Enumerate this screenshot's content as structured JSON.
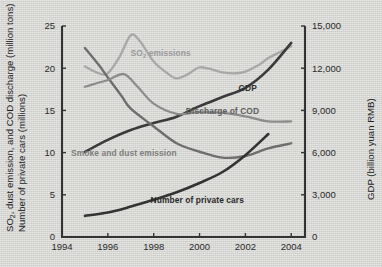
{
  "chart_data": {
    "type": "line",
    "title": "",
    "subtitle": "",
    "xlabel": "",
    "ylabel": "SO2, dust emission, and COD discharge (million tons) Number of private cars (millions)",
    "ylabel_right": "GDP (billion yuan RMB)",
    "xlim": [
      1994,
      2004.6
    ],
    "ylim": [
      0,
      25
    ],
    "ylim_right": [
      0,
      15000
    ],
    "grid": false,
    "legend_position": "inline-annotations",
    "x_ticks": [
      "1994",
      "1996",
      "1998",
      "2000",
      "2002",
      "2004"
    ],
    "x_tick_values": [
      1994,
      1996,
      1998,
      2000,
      2002,
      2004
    ],
    "y_ticks_left": [
      "0",
      "5",
      "10",
      "15",
      "20",
      "25"
    ],
    "y_tick_values_left": [
      0,
      5,
      10,
      15,
      20,
      25
    ],
    "y_ticks_right": [
      "0",
      "3,000",
      "6,000",
      "9,000",
      "12,000",
      "15,000"
    ],
    "y_tick_values_right": [
      0,
      3000,
      6000,
      9000,
      12000,
      15000
    ],
    "series": [
      {
        "name": "SO2 emissions",
        "label": "SO2 emissions",
        "axis": "left",
        "color": "#a8a8a8",
        "width": 2.3,
        "x": [
          1995,
          1995.6,
          1996,
          1996.5,
          1997,
          1997.4,
          1998,
          1998.6,
          1999,
          1999.5,
          2000,
          2000.6,
          2001,
          2001.6,
          2002,
          2002.6,
          2003,
          2003.5,
          2004
        ],
        "values": [
          20.2,
          19.4,
          19.4,
          21.3,
          23.9,
          23.2,
          20.8,
          19.4,
          18.8,
          19.3,
          20.1,
          19.8,
          19.5,
          19.4,
          19.6,
          20.4,
          21.2,
          21.9,
          22.6
        ]
      },
      {
        "name": "GDP",
        "label": "GDP",
        "axis": "right",
        "color": "#3a3a3a",
        "width": 2.6,
        "x": [
          1995,
          1996,
          1997,
          1998,
          1999,
          2000,
          2001,
          2002,
          2003,
          2004
        ],
        "values": [
          6050,
          6900,
          7600,
          8100,
          8550,
          9300,
          9950,
          10600,
          11900,
          13800
        ]
      },
      {
        "name": "Discharge of COD",
        "label": "Discharge of COD",
        "axis": "left",
        "color": "#6e6e6e",
        "width": 2.4,
        "x": [
          1995,
          1995.6,
          1996,
          1996.6,
          1997,
          1998,
          1999,
          2000,
          2001,
          2002,
          2003,
          2004
        ],
        "values": [
          22.4,
          20.4,
          18.9,
          16.7,
          15.2,
          13.1,
          11.1,
          10.1,
          9.4,
          9.6,
          10.5,
          11.1
        ]
      },
      {
        "name": "Smoke and dust emission",
        "label": "Smoke and dust emission",
        "axis": "left",
        "color": "#8c8c8c",
        "width": 2.3,
        "x": [
          1995,
          1996,
          1996.7,
          1997.3,
          1998,
          1999,
          2000,
          2001,
          2002,
          2003,
          2004
        ],
        "values": [
          17.8,
          18.6,
          19.3,
          17.8,
          15.8,
          14.6,
          14.8,
          14.7,
          14.3,
          13.7,
          13.7
        ]
      },
      {
        "name": "Number of private cars",
        "label": "Number of private cars",
        "axis": "left",
        "color": "#333333",
        "width": 2.6,
        "x": [
          1995,
          1996,
          1997,
          1998,
          1999,
          2000,
          2001,
          2002,
          2003
        ],
        "values": [
          2.5,
          2.9,
          3.6,
          4.4,
          5.3,
          6.4,
          7.7,
          9.7,
          12.2
        ]
      }
    ],
    "annotations": [
      {
        "text": "SO2 emissions",
        "x": 1998.3,
        "y": 21.5,
        "color": "#9a9a9a"
      },
      {
        "text": "GDP",
        "x": 2002.1,
        "y": 17.3,
        "color": "#2f2f2f"
      },
      {
        "text": "Discharge of COD",
        "x": 2001.0,
        "y": 14.6,
        "color": "#5e5e5e"
      },
      {
        "text": "Smoke and dust emission",
        "x": 1996.7,
        "y": 9.6,
        "color": "#7d7d7d"
      },
      {
        "text": "Number of private cars",
        "x": 1999.9,
        "y": 4.0,
        "color": "#2a2a2a"
      }
    ]
  },
  "axes": {
    "left_title_line1": "SO2, dust emission, and COD discharge (million tons)",
    "left_title_line2": "Number of private cars (millions)",
    "right_title": "GDP (billion yuan RMB)"
  }
}
